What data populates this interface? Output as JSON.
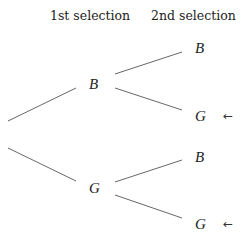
{
  "headers": {
    "first": "1st selection",
    "second": "2nd selection"
  },
  "tree": {
    "level1": [
      {
        "label": "B"
      },
      {
        "label": "G"
      }
    ],
    "level2": [
      {
        "parent": "B",
        "label": "B",
        "marked": false
      },
      {
        "parent": "B",
        "label": "G",
        "marked": true
      },
      {
        "parent": "G",
        "label": "B",
        "marked": false
      },
      {
        "parent": "G",
        "label": "G",
        "marked": true
      }
    ],
    "marker_glyph": "←"
  },
  "colors": {
    "line": "#555555",
    "text": "#222222",
    "background": "#ffffff"
  }
}
